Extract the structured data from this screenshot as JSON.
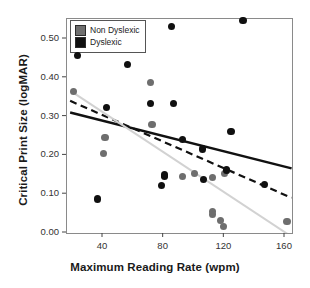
{
  "chart_data": {
    "type": "scatter",
    "title": "",
    "xlabel": "Maximum Reading Rate (wpm)",
    "ylabel": "Critical Print Size (logMAR)",
    "xlim": [
      18,
      165
    ],
    "ylim": [
      -0.02,
      0.565
    ],
    "xticks": [
      40,
      80,
      120,
      160
    ],
    "xtick_labels": [
      "40",
      "80",
      "120",
      "160"
    ],
    "yticks": [
      0.0,
      0.1,
      0.2,
      0.3,
      0.4,
      0.5
    ],
    "ytick_labels": [
      "0.00",
      "0.10",
      "0.20",
      "0.30",
      "0.40",
      "0.50"
    ],
    "grid": false,
    "legend_position": "top-left",
    "series": [
      {
        "name": "Non Dyslexic",
        "color": "#6e6e6e",
        "marker": "circle",
        "points": [
          {
            "x": 21,
            "y": 0.363
          },
          {
            "x": 42,
            "y": 0.244
          },
          {
            "x": 41,
            "y": 0.203
          },
          {
            "x": 72,
            "y": 0.385
          },
          {
            "x": 73,
            "y": 0.278
          },
          {
            "x": 93,
            "y": 0.142
          },
          {
            "x": 101,
            "y": 0.151
          },
          {
            "x": 113,
            "y": 0.14
          },
          {
            "x": 113,
            "y": 0.053
          },
          {
            "x": 113,
            "y": 0.046
          },
          {
            "x": 118,
            "y": 0.029
          },
          {
            "x": 120,
            "y": 0.014
          },
          {
            "x": 122,
            "y": 0.158
          },
          {
            "x": 121,
            "y": 0.15
          },
          {
            "x": 162,
            "y": 0.027
          }
        ]
      },
      {
        "name": "Dyslexic",
        "color": "#101010",
        "marker": "circle",
        "points": [
          {
            "x": 24,
            "y": 0.455
          },
          {
            "x": 37,
            "y": 0.085
          },
          {
            "x": 43,
            "y": 0.32
          },
          {
            "x": 57,
            "y": 0.432
          },
          {
            "x": 72,
            "y": 0.331
          },
          {
            "x": 79,
            "y": 0.12
          },
          {
            "x": 81,
            "y": 0.143
          },
          {
            "x": 81,
            "y": 0.147
          },
          {
            "x": 86,
            "y": 0.529
          },
          {
            "x": 87,
            "y": 0.331
          },
          {
            "x": 93,
            "y": 0.238
          },
          {
            "x": 106,
            "y": 0.214
          },
          {
            "x": 107,
            "y": 0.135
          },
          {
            "x": 122,
            "y": 0.16
          },
          {
            "x": 125,
            "y": 0.26
          },
          {
            "x": 133,
            "y": 0.545
          },
          {
            "x": 147,
            "y": 0.122
          }
        ]
      }
    ],
    "trend_lines": [
      {
        "name": "Dyslexic fit",
        "style": "solid",
        "color": "#111111",
        "x_start": 19,
        "y_start": 0.308,
        "x_end": 165,
        "y_end": 0.164
      },
      {
        "name": "Combined fit",
        "style": "dashed",
        "color": "#111111",
        "x_start": 19,
        "y_start": 0.338,
        "x_end": 165,
        "y_end": 0.088
      },
      {
        "name": "Non Dyslexic fit",
        "style": "solid-light",
        "color": "#d2d2d2",
        "x_start": 20,
        "y_start": 0.362,
        "x_end": 165,
        "y_end": -0.012
      }
    ]
  },
  "legend": {
    "items": [
      {
        "label": "Non Dyslexic",
        "color": "#6e6e6e"
      },
      {
        "label": "Dyslexic",
        "color": "#101010"
      }
    ]
  },
  "frame": {
    "border_color": "#8a8a8a"
  }
}
